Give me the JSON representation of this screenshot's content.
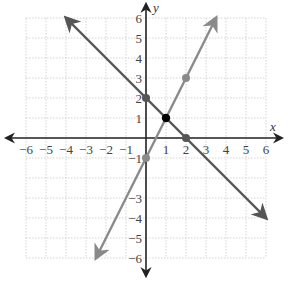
{
  "chart_data": {
    "type": "line",
    "title": "",
    "xlabel": "x",
    "ylabel": "y",
    "xlim": [
      -6,
      6
    ],
    "ylim": [
      -6,
      6
    ],
    "grid": true,
    "x_ticks": [
      "−6",
      "−5",
      "−4",
      "−3",
      "−2",
      "−1",
      "1",
      "2",
      "3",
      "4",
      "5",
      "6"
    ],
    "y_ticks": [
      "6",
      "5",
      "4",
      "3",
      "2",
      "1",
      "−1",
      "−3",
      "−4",
      "−5",
      "−6"
    ],
    "series": [
      {
        "name": "line-slope-neg1",
        "equation": "y = -x + 2",
        "from": [
          -4,
          6
        ],
        "to": [
          6,
          -4
        ],
        "color": "#555555",
        "points": [
          [
            0,
            2
          ],
          [
            2,
            0
          ]
        ]
      },
      {
        "name": "line-slope-2",
        "equation": "y = 2x - 1",
        "from": [
          -2.5,
          -6
        ],
        "to": [
          3.5,
          6
        ],
        "color": "#8a8a8a",
        "points": [
          [
            0,
            -1
          ],
          [
            2,
            3
          ]
        ]
      }
    ],
    "intersection": {
      "point": [
        1,
        1
      ],
      "color": "#000000"
    }
  },
  "labels": {
    "x_axis": "x",
    "y_axis": "y"
  }
}
